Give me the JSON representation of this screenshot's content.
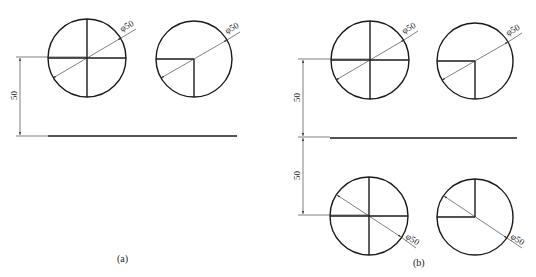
{
  "figure": {
    "panels": [
      {
        "id": "a",
        "caption": "(a)",
        "vertical_dimension": "50",
        "circles": [
          {
            "type": "full-cross",
            "diameter_label": "φ50"
          },
          {
            "type": "quarter-cutout",
            "diameter_label": "φ50"
          }
        ]
      },
      {
        "id": "b",
        "caption": "(b)",
        "vertical_dimension_top": "50",
        "vertical_dimension_bottom": "50",
        "circles": [
          {
            "type": "full-cross",
            "diameter_label": "φ50"
          },
          {
            "type": "quarter-cutout",
            "diameter_label": "φ50"
          },
          {
            "type": "full-cross-mirrored",
            "diameter_label": "φ50"
          },
          {
            "type": "quarter-cutout-mirrored",
            "diameter_label": "φ50"
          }
        ]
      }
    ]
  },
  "colors": {
    "line": "#1a1a1a",
    "background": "#ffffff"
  }
}
